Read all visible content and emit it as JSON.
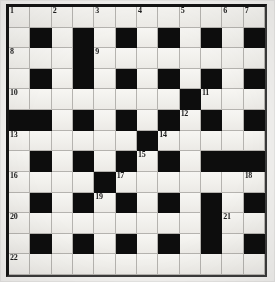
{
  "puzzle": {
    "type": "crossword-grid",
    "title": "",
    "columns": 12,
    "rows": 13,
    "colors": {
      "block": "#0d0d0d",
      "cell": "#f5f4f1",
      "grid_line": "#b5b3af",
      "border": "#141414",
      "number_text": "#1b1b1b",
      "page_background": "#f2f1ef"
    },
    "numbers": [
      1,
      2,
      3,
      4,
      5,
      6,
      7,
      8,
      9,
      10,
      11,
      12,
      13,
      14,
      15,
      16,
      17,
      18,
      19,
      20,
      21,
      22
    ],
    "grid": [
      [
        "1",
        "2",
        "3",
        "4",
        "5",
        "6",
        "7"
      ],
      [
        "8",
        "9"
      ],
      [
        "10",
        "11",
        "12"
      ],
      [
        "13",
        "14",
        "15"
      ],
      [
        "16",
        "17",
        "18",
        "19"
      ],
      [
        "20",
        "21"
      ],
      [
        "22"
      ]
    ],
    "cells": [
      [
        {
          "block": false,
          "number": "1"
        },
        {
          "block": false,
          "number": ""
        },
        {
          "block": false,
          "number": "2"
        },
        {
          "block": false,
          "number": ""
        },
        {
          "block": false,
          "number": "3"
        },
        {
          "block": false,
          "number": ""
        },
        {
          "block": false,
          "number": "4"
        },
        {
          "block": false,
          "number": ""
        },
        {
          "block": false,
          "number": "5"
        },
        {
          "block": false,
          "number": ""
        },
        {
          "block": false,
          "number": "6"
        },
        {
          "block": false,
          "number": "7"
        }
      ],
      [
        {
          "block": false,
          "number": ""
        },
        {
          "block": true,
          "number": ""
        },
        {
          "block": false,
          "number": ""
        },
        {
          "block": true,
          "number": ""
        },
        {
          "block": false,
          "number": ""
        },
        {
          "block": true,
          "number": ""
        },
        {
          "block": false,
          "number": ""
        },
        {
          "block": true,
          "number": ""
        },
        {
          "block": false,
          "number": ""
        },
        {
          "block": true,
          "number": ""
        },
        {
          "block": false,
          "number": ""
        },
        {
          "block": true,
          "number": ""
        }
      ],
      [
        {
          "block": false,
          "number": "8"
        },
        {
          "block": false,
          "number": ""
        },
        {
          "block": false,
          "number": ""
        },
        {
          "block": true,
          "number": ""
        },
        {
          "block": false,
          "number": "9"
        },
        {
          "block": false,
          "number": ""
        },
        {
          "block": false,
          "number": ""
        },
        {
          "block": false,
          "number": ""
        },
        {
          "block": false,
          "number": ""
        },
        {
          "block": false,
          "number": ""
        },
        {
          "block": false,
          "number": ""
        },
        {
          "block": false,
          "number": ""
        }
      ],
      [
        {
          "block": false,
          "number": ""
        },
        {
          "block": true,
          "number": ""
        },
        {
          "block": false,
          "number": ""
        },
        {
          "block": true,
          "number": ""
        },
        {
          "block": false,
          "number": ""
        },
        {
          "block": true,
          "number": ""
        },
        {
          "block": false,
          "number": ""
        },
        {
          "block": true,
          "number": ""
        },
        {
          "block": false,
          "number": ""
        },
        {
          "block": true,
          "number": ""
        },
        {
          "block": false,
          "number": ""
        },
        {
          "block": true,
          "number": ""
        }
      ],
      [
        {
          "block": false,
          "number": "10"
        },
        {
          "block": false,
          "number": ""
        },
        {
          "block": false,
          "number": ""
        },
        {
          "block": false,
          "number": ""
        },
        {
          "block": false,
          "number": ""
        },
        {
          "block": false,
          "number": ""
        },
        {
          "block": false,
          "number": ""
        },
        {
          "block": false,
          "number": ""
        },
        {
          "block": true,
          "number": ""
        },
        {
          "block": false,
          "number": "11"
        },
        {
          "block": false,
          "number": ""
        },
        {
          "block": false,
          "number": ""
        }
      ],
      [
        {
          "block": true,
          "number": ""
        },
        {
          "block": true,
          "number": ""
        },
        {
          "block": false,
          "number": ""
        },
        {
          "block": true,
          "number": ""
        },
        {
          "block": false,
          "number": ""
        },
        {
          "block": true,
          "number": ""
        },
        {
          "block": false,
          "number": ""
        },
        {
          "block": true,
          "number": ""
        },
        {
          "block": false,
          "number": "12"
        },
        {
          "block": true,
          "number": ""
        },
        {
          "block": false,
          "number": ""
        },
        {
          "block": true,
          "number": ""
        }
      ],
      [
        {
          "block": false,
          "number": "13"
        },
        {
          "block": false,
          "number": ""
        },
        {
          "block": false,
          "number": ""
        },
        {
          "block": false,
          "number": ""
        },
        {
          "block": false,
          "number": ""
        },
        {
          "block": false,
          "number": ""
        },
        {
          "block": true,
          "number": ""
        },
        {
          "block": false,
          "number": "14"
        },
        {
          "block": false,
          "number": ""
        },
        {
          "block": false,
          "number": ""
        },
        {
          "block": false,
          "number": ""
        },
        {
          "block": false,
          "number": ""
        }
      ],
      [
        {
          "block": false,
          "number": ""
        },
        {
          "block": true,
          "number": ""
        },
        {
          "block": false,
          "number": ""
        },
        {
          "block": true,
          "number": ""
        },
        {
          "block": false,
          "number": ""
        },
        {
          "block": true,
          "number": ""
        },
        {
          "block": false,
          "number": "15"
        },
        {
          "block": true,
          "number": ""
        },
        {
          "block": false,
          "number": ""
        },
        {
          "block": true,
          "number": ""
        },
        {
          "block": true,
          "number": ""
        },
        {
          "block": true,
          "number": ""
        }
      ],
      [
        {
          "block": false,
          "number": "16"
        },
        {
          "block": false,
          "number": ""
        },
        {
          "block": false,
          "number": ""
        },
        {
          "block": false,
          "number": ""
        },
        {
          "block": true,
          "number": ""
        },
        {
          "block": false,
          "number": "17"
        },
        {
          "block": false,
          "number": ""
        },
        {
          "block": false,
          "number": ""
        },
        {
          "block": false,
          "number": ""
        },
        {
          "block": false,
          "number": ""
        },
        {
          "block": false,
          "number": ""
        },
        {
          "block": false,
          "number": "18"
        }
      ],
      [
        {
          "block": false,
          "number": ""
        },
        {
          "block": true,
          "number": ""
        },
        {
          "block": false,
          "number": ""
        },
        {
          "block": true,
          "number": ""
        },
        {
          "block": false,
          "number": "19"
        },
        {
          "block": true,
          "number": ""
        },
        {
          "block": false,
          "number": ""
        },
        {
          "block": true,
          "number": ""
        },
        {
          "block": false,
          "number": ""
        },
        {
          "block": true,
          "number": ""
        },
        {
          "block": false,
          "number": ""
        },
        {
          "block": true,
          "number": ""
        }
      ],
      [
        {
          "block": false,
          "number": "20"
        },
        {
          "block": false,
          "number": ""
        },
        {
          "block": false,
          "number": ""
        },
        {
          "block": false,
          "number": ""
        },
        {
          "block": false,
          "number": ""
        },
        {
          "block": false,
          "number": ""
        },
        {
          "block": false,
          "number": ""
        },
        {
          "block": false,
          "number": ""
        },
        {
          "block": false,
          "number": ""
        },
        {
          "block": true,
          "number": ""
        },
        {
          "block": false,
          "number": "21"
        },
        {
          "block": false,
          "number": ""
        }
      ],
      [
        {
          "block": false,
          "number": ""
        },
        {
          "block": true,
          "number": ""
        },
        {
          "block": false,
          "number": ""
        },
        {
          "block": true,
          "number": ""
        },
        {
          "block": false,
          "number": ""
        },
        {
          "block": true,
          "number": ""
        },
        {
          "block": false,
          "number": ""
        },
        {
          "block": true,
          "number": ""
        },
        {
          "block": false,
          "number": ""
        },
        {
          "block": true,
          "number": ""
        },
        {
          "block": false,
          "number": ""
        },
        {
          "block": true,
          "number": ""
        }
      ],
      [
        {
          "block": false,
          "number": "22"
        },
        {
          "block": false,
          "number": ""
        },
        {
          "block": false,
          "number": ""
        },
        {
          "block": false,
          "number": ""
        },
        {
          "block": false,
          "number": ""
        },
        {
          "block": false,
          "number": ""
        },
        {
          "block": false,
          "number": ""
        },
        {
          "block": false,
          "number": ""
        },
        {
          "block": false,
          "number": ""
        },
        {
          "block": false,
          "number": ""
        },
        {
          "block": false,
          "number": ""
        },
        {
          "block": false,
          "number": ""
        }
      ]
    ]
  }
}
